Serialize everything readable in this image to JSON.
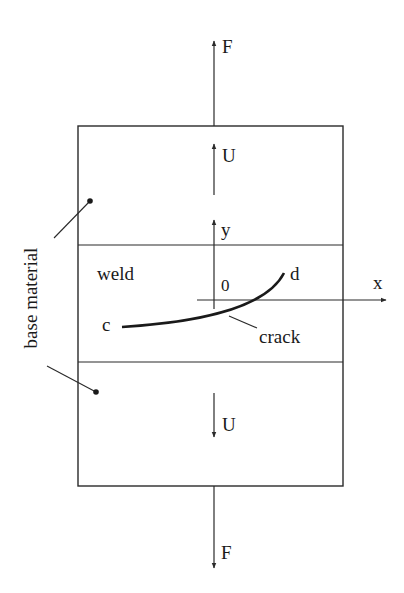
{
  "figure": {
    "labels": {
      "force_top": "F",
      "force_bottom": "F",
      "displacement_top": "U",
      "displacement_bottom": "U",
      "axis_y": "y",
      "axis_x": "x",
      "origin": "0",
      "weld": "weld",
      "crack_start": "c",
      "crack_end": "d",
      "crack": "crack",
      "base_material": "base material"
    },
    "colors": {
      "line": "#2a2a2a",
      "background": "#ffffff"
    }
  }
}
